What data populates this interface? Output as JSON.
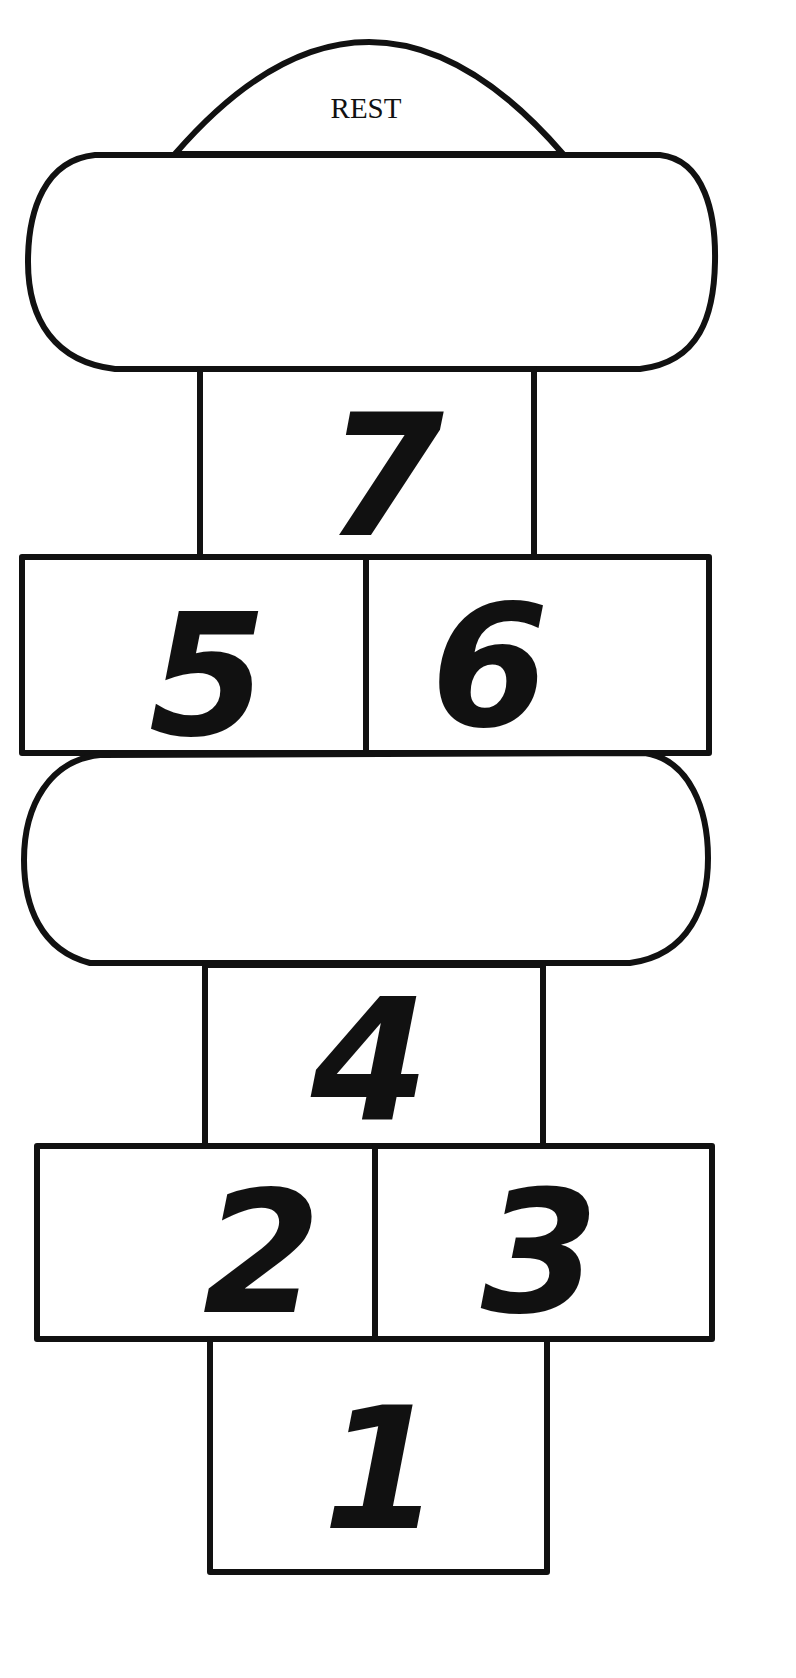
{
  "diagram": {
    "rest_label": "REST",
    "squares": [
      {
        "id": "1",
        "label": "1"
      },
      {
        "id": "2",
        "label": "2"
      },
      {
        "id": "3",
        "label": "3"
      },
      {
        "id": "4",
        "label": "4"
      },
      {
        "id": "5",
        "label": "5"
      },
      {
        "id": "6",
        "label": "6"
      },
      {
        "id": "7",
        "label": "7"
      }
    ],
    "blank_zones": [
      "top-oval",
      "middle-oval"
    ],
    "colors": {
      "line": "#111111",
      "background": "#ffffff"
    }
  }
}
